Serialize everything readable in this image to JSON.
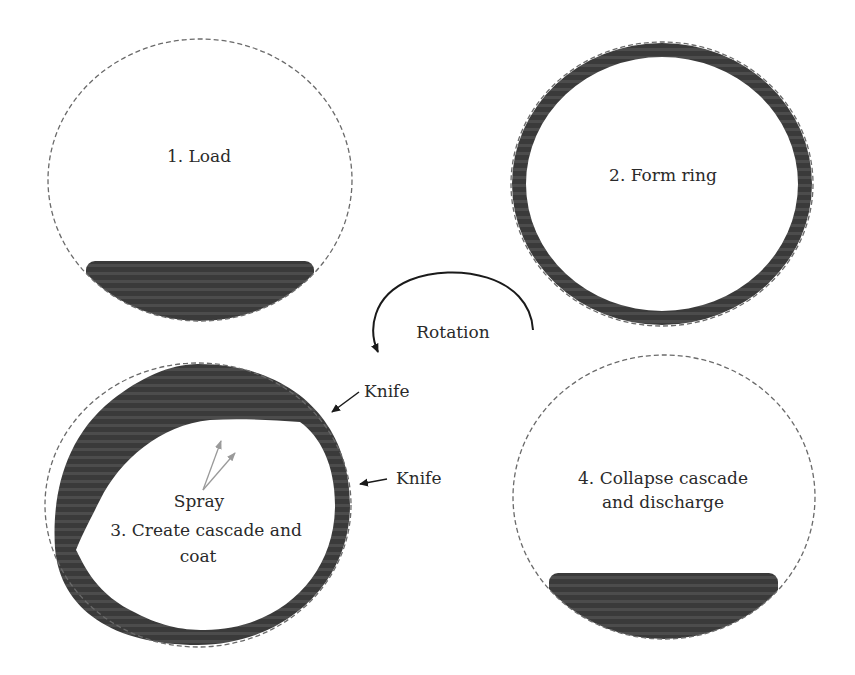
{
  "diagram": {
    "title": "",
    "colors": {
      "material": "#3a3a3a",
      "material_stripe": "#555555",
      "outline": "#6a6a6a",
      "arrow": "#1a1a1a",
      "spray_arrow": "#9a9a9a",
      "text": "#2a2a2a"
    },
    "stages": [
      {
        "id": 1,
        "label": "1. Load"
      },
      {
        "id": 2,
        "label": "2. Form ring"
      },
      {
        "id": 3,
        "label_line1": "3. Create cascade and",
        "label_line2": "coat",
        "spray_label": "Spray"
      },
      {
        "id": 4,
        "label_line1": "4. Collapse cascade",
        "label_line2": "and discharge"
      }
    ],
    "rotation_label": "Rotation",
    "knife_labels": [
      "Knife",
      "Knife"
    ]
  }
}
